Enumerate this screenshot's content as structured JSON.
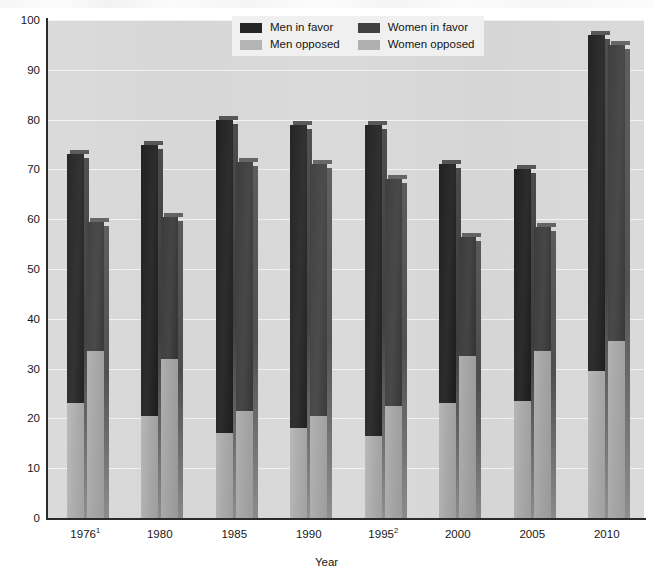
{
  "chart_data": {
    "type": "bar",
    "subtype": "grouped-stacked",
    "title": "",
    "xlabel": "Year",
    "ylabel": "",
    "ylim": [
      0,
      100
    ],
    "ytick_step": 10,
    "yticks": [
      0,
      10,
      20,
      30,
      40,
      50,
      60,
      70,
      80,
      90,
      100
    ],
    "grid": true,
    "grid_axis": "y",
    "legend_position": "top-center",
    "categories": [
      "1976¹",
      "1980",
      "1985",
      "1990",
      "1995²",
      "2000",
      "2005",
      "2010"
    ],
    "category_plain": [
      "1976",
      "1980",
      "1985",
      "1990",
      "1995",
      "2000",
      "2005",
      "2010"
    ],
    "footnote_markers": [
      "1",
      "",
      "",
      "",
      "2",
      "",
      "",
      ""
    ],
    "series": [
      {
        "name": "Men in favor",
        "group": "Men",
        "stack_part": "top",
        "color": "#262626",
        "values": [
          73,
          75,
          80,
          79,
          79,
          71,
          70,
          97
        ]
      },
      {
        "name": "Men opposed",
        "group": "Men",
        "stack_part": "bottom",
        "color": "#b4b4b4",
        "values": [
          23,
          20.5,
          17,
          18,
          16.5,
          23,
          23.5,
          29.5
        ]
      },
      {
        "name": "Women in favor",
        "group": "Women",
        "stack_part": "top",
        "color": "#414141",
        "values": [
          59.5,
          60.5,
          71.5,
          71,
          68,
          56.5,
          58.5,
          95
        ]
      },
      {
        "name": "Women opposed",
        "group": "Women",
        "stack_part": "bottom",
        "color": "#b0b0b0",
        "values": [
          33.5,
          32,
          21.5,
          20.5,
          22.5,
          32.5,
          33.5,
          35.5
        ]
      }
    ]
  },
  "legend": {
    "items": [
      {
        "label": "Men in favor",
        "swatch": "men-favor-swatch"
      },
      {
        "label": "Men opposed",
        "swatch": "men-opposed-swatch"
      },
      {
        "label": "Women in favor",
        "swatch": "women-favor-swatch"
      },
      {
        "label": "Women opposed",
        "swatch": "women-opposed-swatch"
      }
    ]
  },
  "axes": {
    "x_title": "Year",
    "y_labels": [
      "100",
      "90",
      "80",
      "70",
      "60",
      "50",
      "40",
      "30",
      "20",
      "10",
      "0"
    ],
    "x_labels": [
      "1976",
      "1980",
      "1985",
      "1990",
      "1995",
      "2000",
      "2005",
      "2010"
    ],
    "x_sup": [
      "1",
      "",
      "",
      "",
      "2",
      "",
      "",
      ""
    ]
  },
  "colors": {
    "plot_background": "#d9d9d9",
    "gridline": "#f2f2f2",
    "axis": "#2b2b2b",
    "men_favor": "#262626",
    "men_opposed": "#b4b4b4",
    "women_favor": "#414141",
    "women_opposed": "#b0b0b0",
    "legend_background": "#f0f0f0"
  }
}
